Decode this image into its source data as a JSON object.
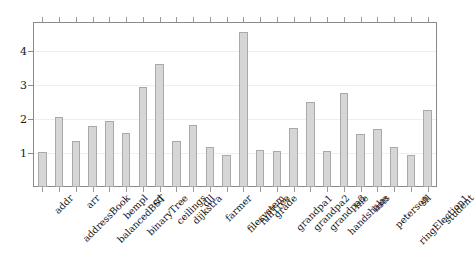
{
  "chart_data": {
    "type": "bar",
    "title": "",
    "subtitle": "",
    "xlabel": "",
    "ylabel": "",
    "ylim": [
      0,
      4.85
    ],
    "yticks": [
      1,
      2,
      3,
      4
    ],
    "ytick_labels": [
      "1",
      "2",
      "3",
      "4"
    ],
    "grid": false,
    "legend": null,
    "bar_fill_color": "#d6d6d6",
    "bar_edge_color": "#a9a9a9",
    "axis_color": "#8a8a8a",
    "categories": [
      "addr",
      "addressBook",
      "arr",
      "balancedBST",
      "bempl",
      "binaryTree",
      "cd",
      "ceilings",
      "dijkstra",
      "dll",
      "farmer",
      "filesystem",
      "fullTree",
      "grade",
      "grandpa1",
      "grandpa2",
      "grandpa3",
      "handshake",
      "life",
      "lists",
      "peterson",
      "ringElection1",
      "sll",
      "student"
    ],
    "values": [
      1.02,
      2.06,
      1.35,
      1.78,
      1.95,
      1.58,
      2.95,
      3.63,
      1.35,
      1.83,
      1.17,
      0.95,
      4.55,
      1.08,
      1.05,
      1.72,
      2.5,
      1.05,
      2.76,
      1.55,
      1.7,
      1.17,
      0.93,
      2.25
    ]
  }
}
